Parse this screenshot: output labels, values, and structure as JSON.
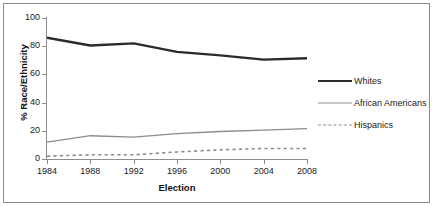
{
  "chart_data": {
    "type": "line",
    "title": "",
    "xlabel": "Election",
    "ylabel": "% Race/Ethnicity",
    "categories": [
      "1984",
      "1988",
      "1992",
      "1996",
      "2000",
      "2004",
      "2008"
    ],
    "x": [
      1984,
      1988,
      1992,
      1996,
      2000,
      2004,
      2008
    ],
    "xlim": [
      1984,
      2008
    ],
    "ylim": [
      0,
      100
    ],
    "yticks": [
      0,
      20,
      40,
      60,
      80,
      100
    ],
    "ytick_labels": [
      "0",
      "20",
      "40",
      "60",
      "80",
      "100"
    ],
    "grid": false,
    "legend_position": "right",
    "series": [
      {
        "name": "Whites",
        "values": [
          86,
          80.5,
          82,
          76,
          73.5,
          70.5,
          71.5
        ],
        "color": "#2b2b2b",
        "line_width": 2.4,
        "dash": "solid"
      },
      {
        "name": "African Americans",
        "values": [
          12,
          16.5,
          15.5,
          18,
          19.5,
          20.5,
          21.5
        ],
        "color": "#8c8c8c",
        "line_width": 1.3,
        "dash": "solid"
      },
      {
        "name": "Hispanics",
        "values": [
          2,
          3,
          3,
          5,
          6.5,
          7.5,
          7.5
        ],
        "color": "#8c8c8c",
        "line_width": 1.6,
        "dash": "dotted"
      }
    ]
  },
  "legend": {
    "entries": [
      {
        "label": "Whites"
      },
      {
        "label": "African Americans"
      },
      {
        "label": "Hispanics"
      }
    ]
  },
  "axes": {
    "y_title": "% Race/Ethnicity",
    "x_title": "Election"
  },
  "colors": {
    "whites": "#2b2b2b",
    "african_americans": "#8c8c8c",
    "hispanics": "#8c8c8c",
    "axis": "#8d8d8d",
    "border": "#8a8a8a",
    "background": "#ffffff"
  }
}
